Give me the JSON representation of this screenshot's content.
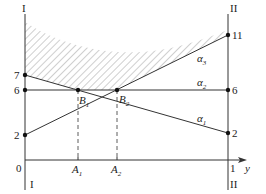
{
  "axes": {
    "left_label_top": "I",
    "left_label_bottom": "I",
    "right_label_top": "II",
    "right_label_bottom": "II",
    "origin_label": "0",
    "right_end_label": "1",
    "x_axis_label": "y"
  },
  "left_ticks": [
    {
      "label": "7"
    },
    {
      "label": "6"
    },
    {
      "label": "2"
    }
  ],
  "right_ticks": [
    {
      "label": "11"
    },
    {
      "label": "6"
    },
    {
      "label": "2"
    }
  ],
  "lines": [
    {
      "label": "α3",
      "from": 2,
      "to": 11
    },
    {
      "label": "α2",
      "from": 6,
      "to": 6
    },
    {
      "label": "α1",
      "from": 7,
      "to": 2
    }
  ],
  "points": [
    {
      "label": "B1",
      "sub": "1"
    },
    {
      "label": "B2",
      "sub": "2"
    }
  ],
  "projections": [
    {
      "label": "A",
      "sub": "1"
    },
    {
      "label": "A",
      "sub": "2"
    }
  ],
  "colors": {
    "line": "#333333",
    "hatch": "#888888"
  }
}
